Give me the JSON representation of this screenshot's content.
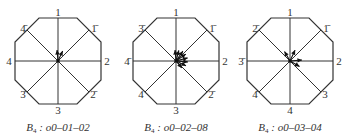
{
  "panels": [
    {
      "cx": 58,
      "cy": 61,
      "labels": {
        "n": "1",
        "ne": "1̄",
        "e": "2",
        "se": "2̄",
        "s": "3",
        "sw": "3̄",
        "w": "4",
        "nw": "4̄"
      },
      "caption": {
        "prefix": "B",
        "sub": "4",
        "text": " : o0–01–02"
      },
      "arrows": [
        {
          "angle": -95,
          "len": 11
        },
        {
          "angle": -65,
          "len": 11
        }
      ]
    },
    {
      "cx": 176,
      "cy": 61,
      "labels": {
        "n": "1",
        "ne": "1̄",
        "e": "2",
        "se": "2̄",
        "s": "3",
        "sw": "4",
        "w": "4̄",
        "nw": "3̄"
      },
      "caption": {
        "prefix": "B",
        "sub": "4",
        "text": " : o0–02–08"
      },
      "arrows": [
        {
          "angle": -95,
          "len": 11
        },
        {
          "angle": -75,
          "len": 11
        },
        {
          "angle": -55,
          "len": 12
        },
        {
          "angle": -35,
          "len": 12
        },
        {
          "angle": -15,
          "len": 12
        },
        {
          "angle": 5,
          "len": 12
        },
        {
          "angle": 25,
          "len": 11
        },
        {
          "angle": 50,
          "len": 9
        }
      ]
    },
    {
      "cx": 290,
      "cy": 61,
      "labels": {
        "n": "1",
        "ne": "1̄",
        "e": "2",
        "se": "3",
        "s": "4",
        "sw": "4̄",
        "w": "3̄",
        "nw": "2̄"
      },
      "caption": {
        "prefix": "B",
        "sub": "4",
        "text": " : o0–03–04"
      },
      "arrows": [
        {
          "angle": -120,
          "len": 11
        },
        {
          "angle": -65,
          "len": 12
        },
        {
          "angle": -5,
          "len": 12
        },
        {
          "angle": 30,
          "len": 11
        }
      ]
    }
  ]
}
